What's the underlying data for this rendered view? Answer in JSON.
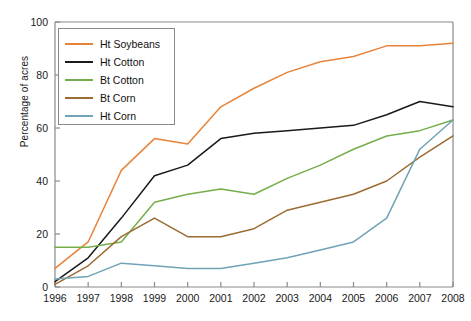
{
  "chart_data": {
    "type": "line",
    "title": "",
    "xlabel": "",
    "ylabel": "Percentage of acres",
    "x": [
      1996,
      1997,
      1998,
      1999,
      2000,
      2001,
      2002,
      2003,
      2004,
      2005,
      2006,
      2007,
      2008
    ],
    "xtick_labels": [
      "1996",
      "1997",
      "1998",
      "1999",
      "2000",
      "2001",
      "2002",
      "2003",
      "2004",
      "2005",
      "2006",
      "2007",
      "2008"
    ],
    "ytick_labels": [
      "0",
      "20",
      "40",
      "60",
      "80",
      "100"
    ],
    "yticks": [
      0,
      20,
      40,
      60,
      80,
      100
    ],
    "xlim": [
      1996,
      2008
    ],
    "ylim": [
      0,
      100
    ],
    "grid": false,
    "legend_position": "upper left",
    "series": [
      {
        "name": "Ht Soybeans",
        "color": "#E8833A",
        "values": [
          7,
          17,
          44,
          56,
          54,
          68,
          75,
          81,
          85,
          87,
          91,
          91,
          92
        ]
      },
      {
        "name": "Ht Cotton",
        "color": "#1a1a1a",
        "values": [
          2,
          11,
          26,
          42,
          46,
          56,
          58,
          59,
          60,
          61,
          65,
          70,
          68
        ]
      },
      {
        "name": "Bt Cotton",
        "color": "#74AE4B",
        "values": [
          15,
          15,
          17,
          32,
          35,
          37,
          35,
          41,
          46,
          52,
          57,
          59,
          63
        ]
      },
      {
        "name": "Bt Corn",
        "color": "#9C6B32",
        "values": [
          1,
          8,
          19,
          26,
          19,
          19,
          22,
          29,
          32,
          35,
          40,
          49,
          57
        ]
      },
      {
        "name": "Ht Corn",
        "color": "#6FA3B5",
        "values": [
          3,
          4,
          9,
          8,
          7,
          7,
          9,
          11,
          14,
          17,
          26,
          52,
          63
        ]
      }
    ]
  },
  "axis": {
    "ylabel": "Percentage of acres"
  }
}
